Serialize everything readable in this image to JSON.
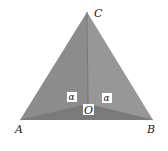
{
  "figure": {
    "vertices": {
      "A": {
        "label": "A",
        "x": 20,
        "y": 120
      },
      "B": {
        "label": "B",
        "x": 153,
        "y": 120
      },
      "C": {
        "label": "C",
        "x": 87,
        "y": 12
      },
      "O": {
        "label": "O",
        "x": 88,
        "y": 104
      }
    },
    "angle_labels": [
      {
        "label": "α",
        "x": 72,
        "y": 100
      },
      {
        "label": "α",
        "x": 107,
        "y": 101
      }
    ],
    "colors": {
      "face_left": "#8c8c8c",
      "face_right": "#979797",
      "face_bottom": "#7a7a7a",
      "edge": "#6a6a6a"
    }
  }
}
